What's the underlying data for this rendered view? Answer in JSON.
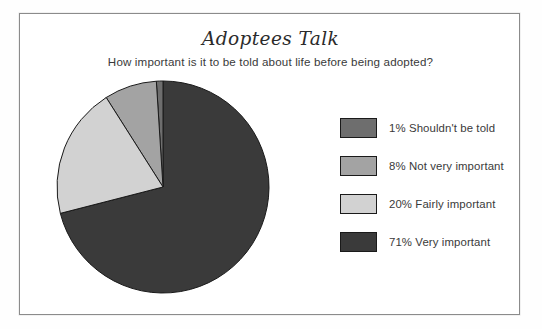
{
  "frame": {
    "border_color": "#8b8b8b",
    "background": "#ffffff"
  },
  "header": {
    "title": "Adoptees Talk",
    "subtitle": "How important is it to be told about life before being adopted?"
  },
  "chart_data": {
    "type": "pie",
    "title": "Adoptees Talk",
    "subtitle": "How important is it to be told about life before being adopted?",
    "xlabel": "",
    "ylabel": "",
    "units": "percent",
    "start_angle_deg": 0,
    "direction": "counterclockwise",
    "legend_position": "right",
    "grid": false,
    "categories": [
      "Shouldn't be told",
      "Not very important",
      "Fairly important",
      "Very important"
    ],
    "values": [
      1,
      8,
      20,
      71
    ],
    "labels": [
      "1% Shouldn't be told",
      "8% Not very important",
      "20% Fairly important",
      "71% Very important"
    ],
    "colors": [
      "#6e6e6e",
      "#a3a3a3",
      "#d2d2d2",
      "#3a3a3a"
    ],
    "slice_border_color": "#1a1a1a",
    "slices": [
      {
        "label": "Shouldn't be told",
        "value": 1,
        "percent": "1%",
        "color": "#6e6e6e"
      },
      {
        "label": "Not very important",
        "value": 8,
        "percent": "8%",
        "color": "#a3a3a3"
      },
      {
        "label": "Fairly important",
        "value": 20,
        "percent": "20%",
        "color": "#d2d2d2"
      },
      {
        "label": "Very important",
        "value": 71,
        "percent": "71%",
        "color": "#3a3a3a"
      }
    ]
  },
  "legend": {
    "items": [
      {
        "swatch_color": "#6e6e6e",
        "label": "1% Shouldn't be told"
      },
      {
        "swatch_color": "#a3a3a3",
        "label": "8% Not very important"
      },
      {
        "swatch_color": "#d2d2d2",
        "label": "20% Fairly important"
      },
      {
        "swatch_color": "#3a3a3a",
        "label": "71% Very important"
      }
    ]
  }
}
